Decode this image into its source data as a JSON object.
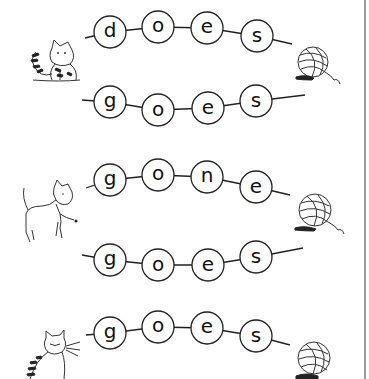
{
  "worksheet": {
    "rows": [
      {
        "word": "does",
        "letters": [
          "d",
          "o",
          "e",
          "s"
        ],
        "centers": [
          [
            110,
            32
          ],
          [
            158,
            27
          ],
          [
            207,
            28
          ],
          [
            257,
            36
          ]
        ],
        "string": [
          [
            85,
            38
          ],
          [
            292,
            44
          ]
        ],
        "pair_group": 1
      },
      {
        "word": "goes",
        "letters": [
          "g",
          "o",
          "e",
          "s"
        ],
        "centers": [
          [
            110,
            102
          ],
          [
            158,
            110
          ],
          [
            208,
            108
          ],
          [
            256,
            101
          ]
        ],
        "string": [
          [
            82,
            100
          ],
          [
            305,
            95
          ]
        ],
        "pair_group": 1
      },
      {
        "word": "gone",
        "letters": [
          "g",
          "o",
          "n",
          "e"
        ],
        "centers": [
          [
            110,
            180
          ],
          [
            158,
            175
          ],
          [
            207,
            177
          ],
          [
            256,
            187
          ]
        ],
        "string": [
          [
            86,
            188
          ],
          [
            290,
            195
          ]
        ],
        "pair_group": 2
      },
      {
        "word": "goes",
        "letters": [
          "g",
          "o",
          "e",
          "s"
        ],
        "centers": [
          [
            110,
            260
          ],
          [
            158,
            265
          ],
          [
            208,
            265
          ],
          [
            256,
            257
          ]
        ],
        "string": [
          [
            82,
            255
          ],
          [
            303,
            248
          ]
        ],
        "pair_group": 2
      },
      {
        "word": "goes",
        "letters": [
          "g",
          "o",
          "e",
          "s"
        ],
        "centers": [
          [
            110,
            333
          ],
          [
            158,
            327
          ],
          [
            207,
            328
          ],
          [
            256,
            336
          ]
        ],
        "string": [
          [
            86,
            335
          ],
          [
            290,
            345
          ]
        ],
        "pair_group": 3
      }
    ],
    "illustrations": [
      {
        "name": "striped-kitten-icon",
        "x": 25,
        "y": 40
      },
      {
        "name": "yarn-ball-icon",
        "x": 298,
        "y": 50
      },
      {
        "name": "white-kitten-icon",
        "x": 20,
        "y": 180
      },
      {
        "name": "yarn-ball-icon",
        "x": 298,
        "y": 200
      },
      {
        "name": "tabby-cat-icon",
        "x": 20,
        "y": 330
      },
      {
        "name": "yarn-ball-icon",
        "x": 298,
        "y": 345
      }
    ],
    "colors": {
      "ink": "#222222",
      "paper": "#ffffff",
      "border": "#9a9a9a"
    }
  }
}
